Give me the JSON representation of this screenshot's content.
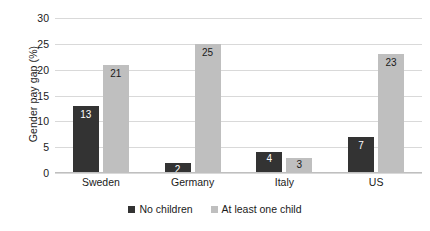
{
  "chart_data": {
    "type": "bar",
    "title": "",
    "xlabel": "",
    "ylabel": "Gender pay gap (%)",
    "ylim": [
      0,
      30
    ],
    "ytick_labels": [
      "30",
      "25",
      "20",
      "15",
      "10",
      "5",
      "0"
    ],
    "ytick_values": [
      30,
      25,
      20,
      15,
      10,
      5,
      0
    ],
    "grid": true,
    "legend_position": "bottom",
    "categories": [
      "Sweden",
      "Germany",
      "Italy",
      "US"
    ],
    "series": [
      {
        "name": "No children",
        "color": "#333333",
        "values": [
          13,
          2,
          4,
          7
        ],
        "labels": [
          "13",
          "2",
          "4",
          "7"
        ]
      },
      {
        "name": "At least one child",
        "color": "#bfbfbf",
        "values": [
          21,
          25,
          3,
          23
        ],
        "labels": [
          "21",
          "25",
          "3",
          "23"
        ]
      }
    ]
  },
  "colors": {
    "series_dark": "#333333",
    "series_light": "#bfbfbf",
    "gridline": "#d9d9d9",
    "text": "#1a1a1a",
    "background": "#ffffff"
  }
}
